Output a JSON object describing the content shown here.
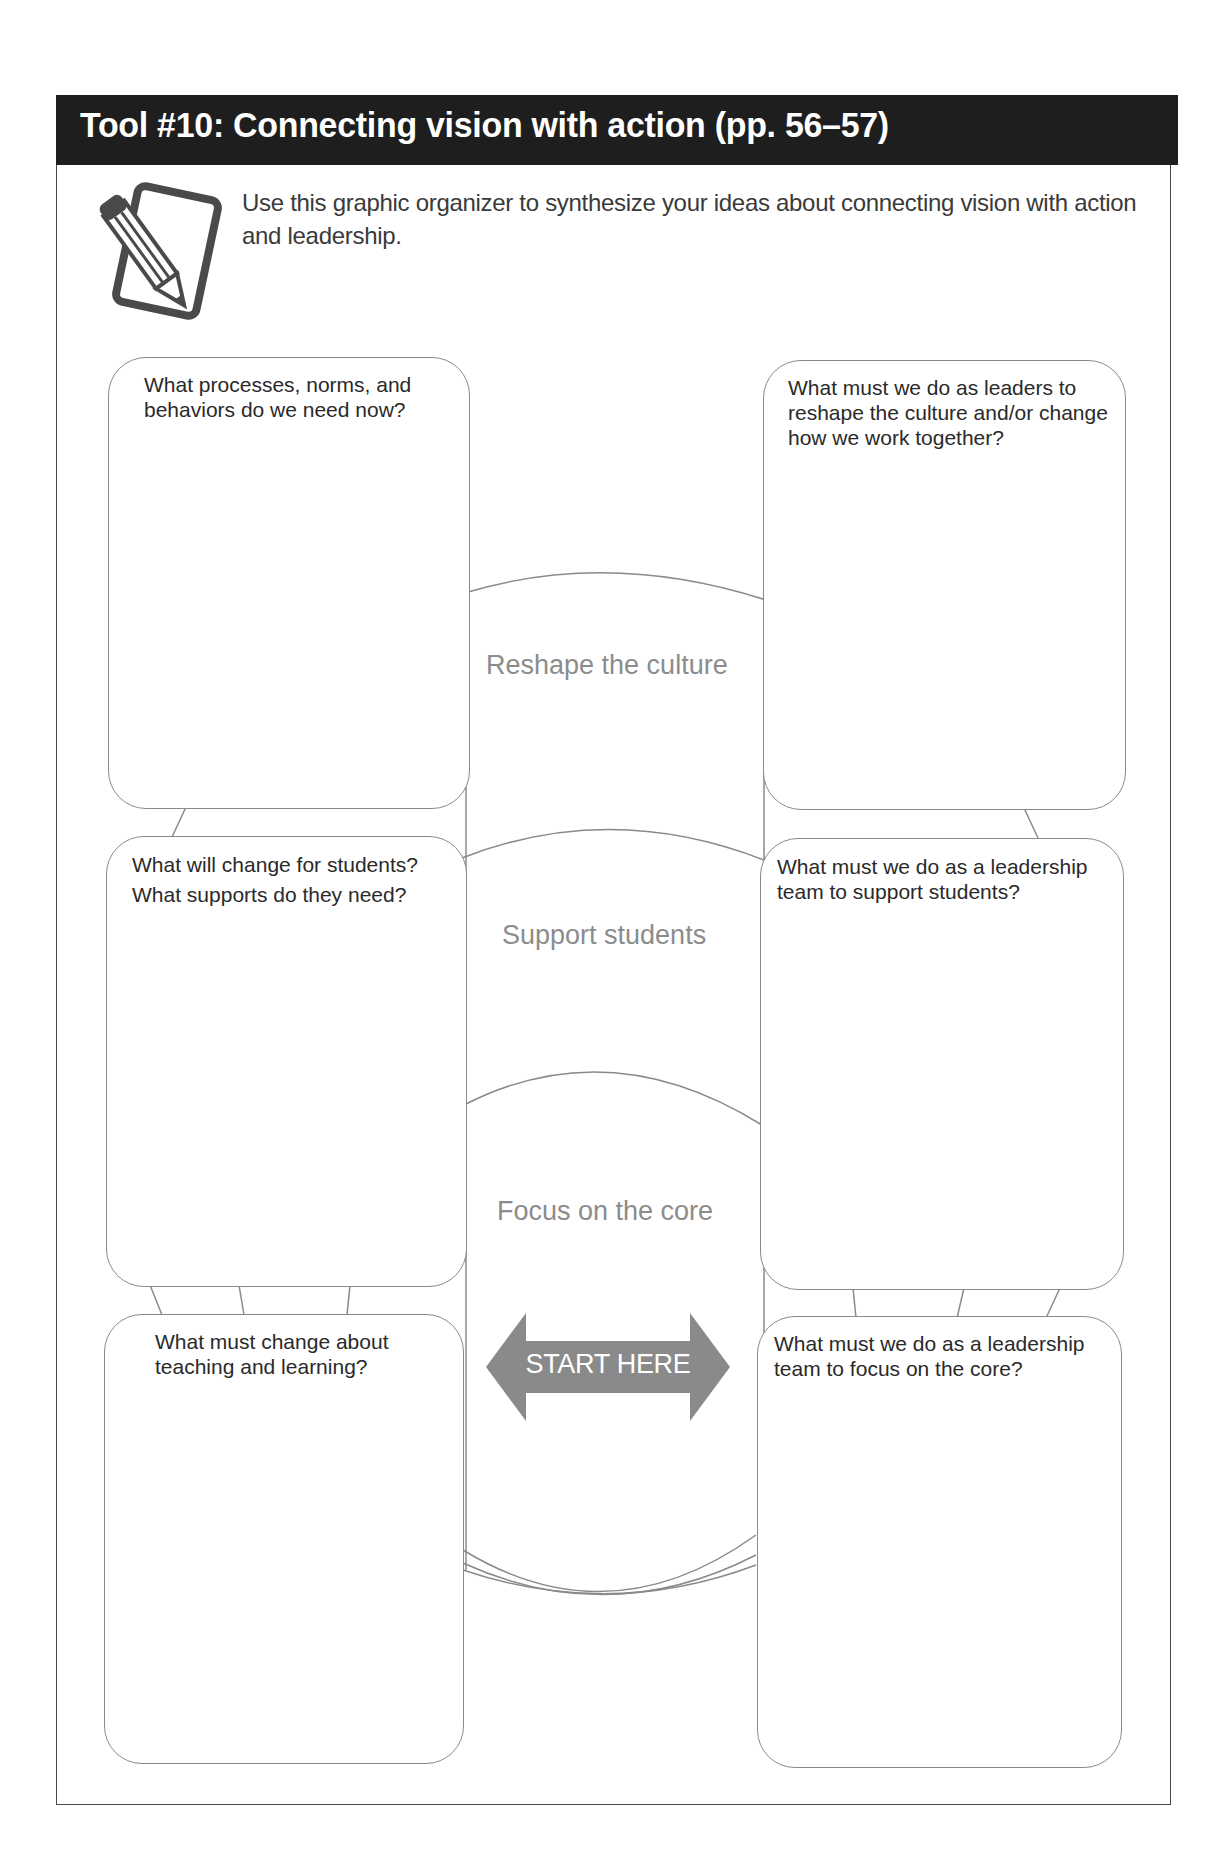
{
  "header": {
    "title": "Tool #10: Connecting vision with action (pp. 56–57)",
    "background_color": "#1e1e1e",
    "text_color": "#ffffff"
  },
  "intro": {
    "icon": "pencil-notepad-icon",
    "text": "Use this graphic organizer to synthesize your ideas about connecting vision with action and leadership."
  },
  "center_labels": {
    "top": "Reshape the culture",
    "middle": "Support students",
    "bottom": "Focus on the core"
  },
  "start_arrow": {
    "label": "START HERE",
    "icon": "double-headed-arrow-icon",
    "color": "#8a8a8a"
  },
  "boxes": {
    "left": [
      {
        "question": "What processes, norms, and behaviors do we need now?"
      },
      {
        "question": "What will change for students? What supports do they need?"
      },
      {
        "question": "What must change about teaching and learning?"
      }
    ],
    "right": [
      {
        "question": "What must we do as leaders to reshape the culture and/or change how we work together?"
      },
      {
        "question": "What must we do as a leadership team to support students?"
      },
      {
        "question": "What must we do as a leadership team to focus on the core?"
      }
    ]
  }
}
